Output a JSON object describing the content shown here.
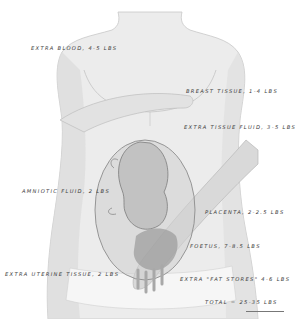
{
  "diagram": {
    "labels": [
      {
        "id": "extra-blood",
        "text": "Extra blood, 4-5 lbs"
      },
      {
        "id": "breast-tissue",
        "text": "Breast tissue, 1-4 lbs"
      },
      {
        "id": "extra-tissue-fluid",
        "text": "Extra tissue fluid, 3-5 lbs"
      },
      {
        "id": "amniotic-fluid",
        "text": "Amniotic fluid, 2 lbs"
      },
      {
        "id": "placenta",
        "text": "Placenta, 2-2.5 lbs"
      },
      {
        "id": "foetus",
        "text": "Foetus, 7-8.5 lbs"
      },
      {
        "id": "extra-uterine-tissue",
        "text": "Extra uterine tissue, 2 lbs"
      },
      {
        "id": "extra-fat-stores",
        "text": "Extra \"fat stores\" 4-6 lbs"
      },
      {
        "id": "total",
        "text": "Total = 25-35 lbs"
      }
    ]
  }
}
